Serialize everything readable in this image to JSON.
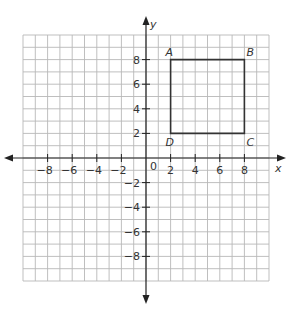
{
  "diagram": {
    "type": "coordinate-plane",
    "x_axis": {
      "label": "x",
      "min": -10,
      "max": 10,
      "ticks": [
        -8,
        -6,
        -4,
        -2,
        2,
        4,
        6,
        8
      ]
    },
    "y_axis": {
      "label": "y",
      "min": -10,
      "max": 10,
      "ticks": [
        -8,
        -6,
        -4,
        -2,
        2,
        4,
        6,
        8
      ]
    },
    "origin_label": "0",
    "grid_step": 1,
    "polygon": {
      "name": "ABCD",
      "vertices": [
        {
          "label": "A",
          "x": 2,
          "y": 8
        },
        {
          "label": "B",
          "x": 8,
          "y": 8
        },
        {
          "label": "C",
          "x": 8,
          "y": 2
        },
        {
          "label": "D",
          "x": 2,
          "y": 2
        }
      ]
    },
    "colors": {
      "grid": "#b8b8b8",
      "axis": "#222222",
      "shape": "#333333"
    }
  }
}
